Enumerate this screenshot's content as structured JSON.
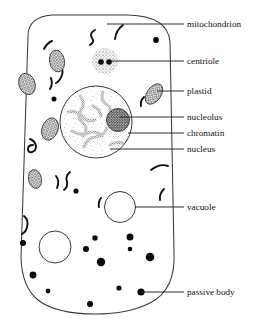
{
  "figure": {
    "type": "biological-schematic",
    "canvas": {
      "width": 258,
      "height": 321
    },
    "colors": {
      "background": "#ffffff",
      "outline": "#3a3a3a",
      "cytoplasm_fill": "#ffffff",
      "stipple": "#6b6b6b",
      "organelle_dark": "#111111",
      "plastid_hatch": "#555555",
      "leader_line": "#222222",
      "label_text": "#111111"
    }
  },
  "cell": {
    "name": "cell-outline",
    "shape": "rounded-rectangle",
    "stipple_label": "cytoplasm-stipple"
  },
  "labels": [
    {
      "id": "mitochondrion",
      "text": "mitochondrion",
      "leader_y": 24,
      "leader_x_start": 107,
      "leader_x_end": 184,
      "text_x": 187
    },
    {
      "id": "centriole",
      "text": "centriole",
      "leader_y": 61,
      "leader_x_start": 108,
      "leader_x_end": 184,
      "text_x": 187
    },
    {
      "id": "plastid",
      "text": "plastid",
      "leader_y": 91,
      "leader_x_start": 157,
      "leader_x_end": 184,
      "text_x": 187
    },
    {
      "id": "nucleolus",
      "text": "nucleolus",
      "leader_y": 117,
      "leader_x_start": 120,
      "leader_x_end": 184,
      "text_x": 187
    },
    {
      "id": "chromatin",
      "text": "chromatin",
      "leader_y": 133,
      "leader_x_start": 128,
      "leader_x_end": 184,
      "text_x": 187
    },
    {
      "id": "nucleus",
      "text": "nucleus",
      "leader_y": 149,
      "leader_x_start": 110,
      "leader_x_end": 184,
      "text_x": 187
    },
    {
      "id": "vacuole",
      "text": "vacuole",
      "leader_y": 207,
      "leader_x_start": 135,
      "leader_x_end": 184,
      "text_x": 187
    },
    {
      "id": "passive-body",
      "text": "passive body",
      "leader_y": 292,
      "leader_x_start": 141,
      "leader_x_end": 184,
      "text_x": 187
    }
  ],
  "organelles": {
    "mitochondria": [
      {
        "id": "m1",
        "path": "M 44 49 q 3 -6 8 -8"
      },
      {
        "id": "m2",
        "path": "M 95 30 q -6 3 -3 8 q 3 4 -2 7"
      },
      {
        "id": "m3",
        "path": "M 123 25 q -7 5 -8 14"
      },
      {
        "id": "m4",
        "path": "M 59 64 q 5 4 3 11 q -2 6 -6 8"
      },
      {
        "id": "m5",
        "path": "M 51 78 q 2 6 -1 11"
      },
      {
        "id": "m6",
        "path": "M 30 139 q 5 2 6 7 q 0 5 -4 6 q -4 1 -4 -3 q 0 -4 5 -4"
      },
      {
        "id": "m7",
        "path": "M 144 97 q -4 4 -3 9"
      },
      {
        "id": "m8",
        "path": "M 56 176 q 4 5 1 12"
      },
      {
        "id": "m9",
        "path": "M 70 172 q -5 4 -3 10 q 1 5 -3 8"
      },
      {
        "id": "m10",
        "path": "M 151 170 q 9 -7 17 -4"
      },
      {
        "id": "m11",
        "path": "M 101 198 q -3 4 -2 9"
      },
      {
        "id": "m12",
        "path": "M 164 189 q -5 5 -4 11"
      },
      {
        "id": "m13",
        "path": "M 24 216 q 5 4 3 11 q -1 5 -5 7"
      }
    ],
    "plastids": [
      {
        "id": "p1",
        "cx": 57,
        "cy": 61,
        "rx": 7.5,
        "ry": 11,
        "angle": -10
      },
      {
        "id": "p2",
        "cx": 27,
        "cy": 84,
        "rx": 8,
        "ry": 11,
        "angle": -20
      },
      {
        "id": "p3",
        "cx": 50,
        "cy": 129,
        "rx": 8,
        "ry": 11.5,
        "angle": 20
      },
      {
        "id": "p4",
        "cx": 154,
        "cy": 94,
        "rx": 7,
        "ry": 11.5,
        "angle": 35
      },
      {
        "id": "p5",
        "cx": 35,
        "cy": 179,
        "rx": 6.5,
        "ry": 9.5,
        "angle": -12
      }
    ],
    "centriole": {
      "id": "centriole-body",
      "cx": 105,
      "cy": 61,
      "r": 13,
      "dots": [
        {
          "cx": 101,
          "cy": 62,
          "r": 2.8
        },
        {
          "cx": 109,
          "cy": 62,
          "r": 2.8
        }
      ]
    },
    "nucleus": {
      "id": "nucleus-body",
      "cx": 96,
      "cy": 122,
      "r": 36
    },
    "nucleolus": {
      "id": "nucleolus-body",
      "cx": 118,
      "cy": 120,
      "r": 11.5
    },
    "chromatin_paths": [
      "M 80 96 q 6 7 1 14 q -5 7 2 13 q 6 6 0 13",
      "M 103 92 q -3 8 3 12 q 7 4 3 11",
      "M 68 112 q 9 -2 14 4 q 5 7 13 4",
      "M 72 131 q 8 5 16 2 q 8 -3 14 3",
      "M 84 147 q 3 -9 11 -10 q 9 -1 12 -9",
      "M 125 100 q 8 -3 13 3",
      "M 132 134 q 6 4 13 2",
      "M 110 145 q 6 -4 13 -2",
      "M 93 106 q 7 3 8 10"
    ],
    "vacuoles": [
      {
        "id": "v1",
        "cx": 120,
        "cy": 207,
        "r": 15.5
      },
      {
        "id": "v2",
        "cx": 55,
        "cy": 247,
        "r": 16
      }
    ],
    "passive_bodies": [
      {
        "id": "pb1",
        "cx": 156,
        "cy": 40,
        "r": 2.9
      },
      {
        "id": "pb2",
        "cx": 54,
        "cy": 99,
        "r": 2.5
      },
      {
        "id": "pb3",
        "cx": 23,
        "cy": 243,
        "r": 3.0
      },
      {
        "id": "pb4",
        "cx": 95,
        "cy": 238,
        "r": 2.7
      },
      {
        "id": "pb5",
        "cx": 130,
        "cy": 237,
        "r": 3.5
      },
      {
        "id": "pb6",
        "cx": 130,
        "cy": 249,
        "r": 2.3
      },
      {
        "id": "pb7",
        "cx": 86,
        "cy": 249,
        "r": 3.0
      },
      {
        "id": "pb8",
        "cx": 101,
        "cy": 262,
        "r": 4.2
      },
      {
        "id": "pb9",
        "cx": 150,
        "cy": 257,
        "r": 4.3
      },
      {
        "id": "pb10",
        "cx": 33,
        "cy": 275,
        "r": 3.4
      },
      {
        "id": "pb11",
        "cx": 48,
        "cy": 291,
        "r": 2.4
      },
      {
        "id": "pb12",
        "cx": 119,
        "cy": 288,
        "r": 2.6
      },
      {
        "id": "pb13",
        "cx": 141,
        "cy": 292,
        "r": 3.6
      },
      {
        "id": "pb14",
        "cx": 90,
        "cy": 304,
        "r": 3.0
      },
      {
        "id": "pb15",
        "cx": 76,
        "cy": 191,
        "r": 2.6
      }
    ]
  }
}
